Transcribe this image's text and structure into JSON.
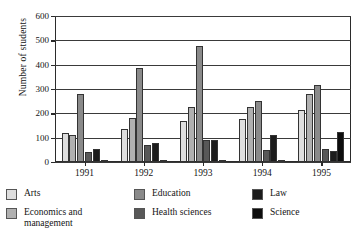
{
  "chart_data": {
    "type": "bar",
    "title": "",
    "subtitle": "",
    "xlabel": "",
    "ylabel": "Number of students",
    "categories": [
      "1991",
      "1992",
      "1993",
      "1994",
      "1995"
    ],
    "ylim": [
      0,
      600
    ],
    "yticks": [
      0,
      100,
      200,
      300,
      400,
      500,
      600
    ],
    "ytick_labels": [
      "0",
      "100",
      "200",
      "300",
      "400",
      "500",
      "600"
    ],
    "grid": "horizontal",
    "legend_position": "bottom",
    "series": [
      {
        "name": "Arts",
        "color": "#dedede",
        "values": [
          118,
          137,
          170,
          178,
          212
        ]
      },
      {
        "name": "Economics and\nmanagement",
        "color": "#b0b0b0",
        "values": [
          110,
          180,
          225,
          228,
          280
        ]
      },
      {
        "name": "Education",
        "color": "#8a8a8a",
        "values": [
          278,
          385,
          475,
          250,
          315
        ]
      },
      {
        "name": "Health sciences",
        "color": "#585858",
        "values": [
          40,
          68,
          90,
          50,
          53
        ]
      },
      {
        "name": "Law",
        "color": "#1c1c1c",
        "values": [
          55,
          78,
          92,
          112,
          45
        ]
      },
      {
        "name": "Science",
        "color": "#0d0d0d",
        "values": [
          5,
          5,
          5,
          5,
          125
        ]
      }
    ]
  },
  "legend": {
    "columns": [
      [
        {
          "label": "Arts",
          "color": "#dedede"
        },
        {
          "label": "Economics and\nmanagement",
          "color": "#b0b0b0"
        }
      ],
      [
        {
          "label": "Education",
          "color": "#8a8a8a"
        },
        {
          "label": "Health sciences",
          "color": "#585858"
        }
      ],
      [
        {
          "label": "Law",
          "color": "#1c1c1c"
        },
        {
          "label": "Science",
          "color": "#0d0d0d"
        }
      ]
    ]
  },
  "axis": {
    "frame_color": "#2b2b2b",
    "grid_color": "#3a3a3a"
  }
}
